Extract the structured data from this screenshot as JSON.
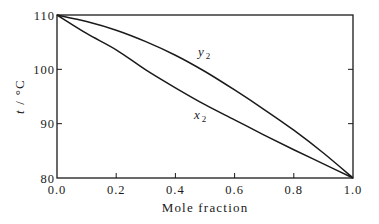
{
  "chart_data": {
    "type": "line",
    "title": "",
    "xlabel": "Mole fraction",
    "ylabel": "t / °C",
    "xlim": [
      0.0,
      1.0
    ],
    "ylim": [
      80,
      110
    ],
    "xticks": [
      0.0,
      0.2,
      0.4,
      0.6,
      0.8,
      1.0
    ],
    "xtick_labels": [
      "0.0",
      "0.2",
      "0.4",
      "0.6",
      "0.8",
      "1.0"
    ],
    "yticks": [
      80,
      90,
      100,
      110
    ],
    "ytick_labels": [
      "80",
      "90",
      "100",
      "110"
    ],
    "grid": false,
    "legend": "none (inline labels)",
    "series": [
      {
        "name": "y2",
        "label_main": "y",
        "label_sub": "2",
        "x": [
          0.0,
          0.1,
          0.2,
          0.3,
          0.4,
          0.5,
          0.6,
          0.7,
          0.8,
          0.9,
          1.0
        ],
        "values": [
          110.0,
          108.8,
          107.2,
          105.1,
          102.6,
          99.6,
          96.2,
          92.6,
          88.8,
          84.6,
          80.0
        ]
      },
      {
        "name": "x2",
        "label_main": "x",
        "label_sub": "2",
        "x": [
          0.0,
          0.1,
          0.2,
          0.3,
          0.4,
          0.5,
          0.6,
          0.7,
          0.8,
          0.9,
          1.0
        ],
        "values": [
          110.0,
          106.6,
          103.6,
          99.9,
          96.6,
          93.5,
          90.7,
          87.9,
          85.2,
          82.6,
          80.0
        ]
      }
    ],
    "annotations": [
      {
        "text": "y2",
        "series": "y2",
        "at_x": 0.49
      },
      {
        "text": "x2",
        "series": "x2",
        "at_x": 0.48
      }
    ]
  }
}
